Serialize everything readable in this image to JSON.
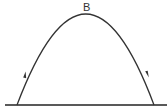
{
  "diagram": {
    "type": "projectile-trajectory",
    "labels": {
      "apex": "B"
    },
    "curve": {
      "start": [
        17,
        105
      ],
      "apex": [
        88,
        14
      ],
      "end": [
        154,
        105
      ],
      "stroke": "#333333"
    },
    "ground": {
      "x1": 5,
      "x2": 167,
      "y": 105,
      "stroke": "#222222"
    },
    "arrows": [
      {
        "position": [
          25,
          74
        ],
        "direction": "up"
      },
      {
        "position": [
          147,
          74
        ],
        "direction": "down"
      }
    ]
  }
}
